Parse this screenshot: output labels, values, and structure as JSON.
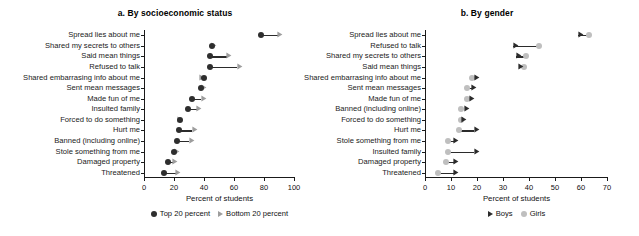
{
  "chart_data": [
    {
      "type": "scatter",
      "title": "a. By socioeconomic status",
      "xlabel": "Percent of students",
      "ylabel": "",
      "xlim": [
        0,
        100
      ],
      "xticks": [
        0,
        20,
        40,
        60,
        80,
        100
      ],
      "grid": false,
      "legend_position": "bottom",
      "categories": [
        "Spread lies about me",
        "Shared my secrets to others",
        "Said mean things",
        "Refused to talk",
        "Shared embarrasing info about me",
        "Sent mean messages",
        "Made fun of me",
        "Insulted family",
        "Forced to do something",
        "Hurt me",
        "Banned (including online)",
        "Stole something from me",
        "Damaged property",
        "Threatened"
      ],
      "series": [
        {
          "name": "Top 20 percent",
          "marker": "circle",
          "color": "#2e2e2e",
          "values": [
            78,
            45,
            44,
            44,
            40,
            38,
            32,
            29,
            24,
            23,
            22,
            20,
            16,
            13
          ]
        },
        {
          "name": "Bottom 20 percent",
          "marker": "arrow",
          "color": "#9d9d9d",
          "values": [
            89,
            45,
            55,
            62,
            37,
            38,
            38,
            35,
            22,
            32,
            30,
            20,
            19,
            21
          ]
        }
      ]
    },
    {
      "type": "scatter",
      "title": "b. By gender",
      "xlabel": "Percent of students",
      "ylabel": "",
      "xlim": [
        0,
        70
      ],
      "xticks": [
        0,
        10,
        20,
        30,
        40,
        50,
        60,
        70
      ],
      "grid": false,
      "legend_position": "bottom",
      "categories": [
        "Spread lies about me",
        "Refused to talk",
        "Shared my secrets to others",
        "Said mean things",
        "Shared embarrasing info about me",
        "Sent mean messages",
        "Made fun of me",
        "Banned (including online)",
        "Forced to do something",
        "Hurt me",
        "Stole something from me",
        "Insulted family",
        "Damaged property",
        "Threatened"
      ],
      "series": [
        {
          "name": "Boys",
          "marker": "arrow",
          "color": "#2b2b2b",
          "values": [
            59,
            34,
            35,
            36,
            19,
            18,
            17,
            15,
            14,
            19,
            11,
            19,
            11,
            11
          ]
        },
        {
          "name": "Girls",
          "marker": "circle",
          "color": "#bfbfbf",
          "values": [
            63,
            44,
            39,
            38,
            18,
            16,
            16,
            14,
            14,
            13,
            9,
            9,
            8,
            5
          ]
        }
      ]
    }
  ]
}
